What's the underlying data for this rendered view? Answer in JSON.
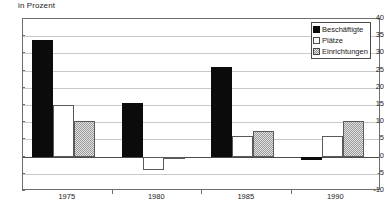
{
  "chart_data": {
    "type": "bar",
    "title": "",
    "xlabel": "",
    "ylabel": "in Prozent",
    "categories": [
      "1975",
      "1980",
      "1985",
      "1990"
    ],
    "series": [
      {
        "name": "Beschäftigte",
        "values": [
          34.0,
          15.5,
          26.0,
          -1.0
        ],
        "color": "#0b0b0b",
        "fill": "solid-black"
      },
      {
        "name": "Plätze",
        "values": [
          15.0,
          -4.0,
          6.0,
          6.0
        ],
        "color": "#ffffff",
        "fill": "white-outline"
      },
      {
        "name": "Einrichtungen",
        "values": [
          10.5,
          -0.5,
          7.5,
          10.5
        ],
        "color": "#cccccc",
        "fill": "gray-checker"
      }
    ],
    "ylim": [
      -10,
      40
    ],
    "yticks": [
      40,
      35,
      30,
      25,
      20,
      15,
      10,
      5,
      0,
      -5,
      -10
    ],
    "ytick_labels": [
      "40",
      "35",
      "30",
      "25",
      "20",
      "15",
      "10",
      "5",
      "0",
      "-5",
      "-10"
    ],
    "grid": true,
    "grid_axis": "y",
    "legend_position": "top-right",
    "zero_line": true
  },
  "axis": {
    "y_title": "in Prozent"
  },
  "legend": {
    "items": [
      {
        "label": "Beschäftigte"
      },
      {
        "label": "Plätze"
      },
      {
        "label": "Einrichtungen"
      }
    ]
  },
  "footnote": {
    "text": ""
  }
}
